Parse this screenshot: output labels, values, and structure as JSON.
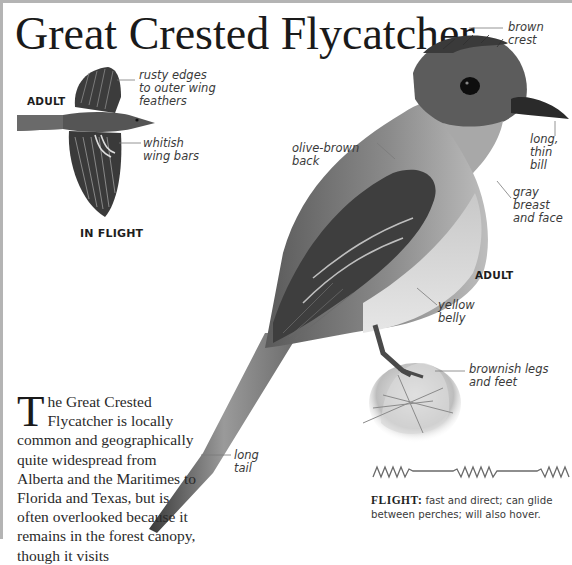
{
  "title": "Great Crested Flycatcher",
  "inset": {
    "age_label": "ADULT",
    "caption": "IN FLIGHT",
    "annotations": [
      {
        "id": "rusty-edges",
        "lines": [
          "rusty edges",
          "to outer wing",
          "feathers"
        ]
      },
      {
        "id": "wing-bars",
        "lines": [
          "whitish",
          "wing bars"
        ]
      }
    ]
  },
  "main_illustration": {
    "age_label": "ADULT",
    "annotations": [
      {
        "id": "crest",
        "lines": [
          "brown",
          "crest"
        ]
      },
      {
        "id": "bill",
        "lines": [
          "long,",
          "thin",
          "bill"
        ]
      },
      {
        "id": "back",
        "lines": [
          "olive-brown",
          "back"
        ]
      },
      {
        "id": "breast",
        "lines": [
          "gray breast",
          "and face"
        ]
      },
      {
        "id": "belly",
        "lines": [
          "yellow",
          "belly"
        ]
      },
      {
        "id": "legs",
        "lines": [
          "brownish legs",
          "and feet"
        ]
      },
      {
        "id": "tail",
        "lines": [
          "long",
          "tail"
        ]
      }
    ]
  },
  "description": {
    "dropcap": "T",
    "text": "he Great Crested Flycatcher is locally common and geographically quite widespread from Alberta and the Maritimes to Florida and Texas, but is often overlooked because it remains in the forest canopy, though it visits"
  },
  "flight": {
    "label": "FLIGHT:",
    "text": " fast and direct; can glide between perches; will also hover.",
    "pattern_icon": "zigzag-glide-flight-pattern"
  },
  "colors": {
    "border": "#b4b4b4",
    "text": "#1a1a1a",
    "label_line": "#7a7a7a"
  }
}
